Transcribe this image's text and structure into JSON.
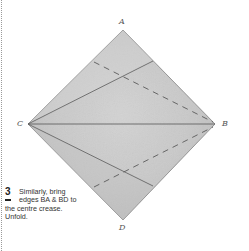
{
  "diagram": {
    "vertices": {
      "A": {
        "label": "A",
        "x": 123,
        "y": 30
      },
      "B": {
        "label": "B",
        "x": 215,
        "y": 124
      },
      "C": {
        "label": "C",
        "x": 28,
        "y": 124
      },
      "D": {
        "label": "D",
        "x": 123,
        "y": 220
      }
    },
    "paper_color": "#cbcbcb",
    "paper_edge_color": "#8a8a8a",
    "crease_color": "#555555",
    "creases": [
      {
        "type": "solid",
        "from": "C",
        "to": "B",
        "description": "centre crease"
      },
      {
        "type": "solid",
        "from": "C",
        "to": "point on AB",
        "x1": 28,
        "y1": 124,
        "x2": 153,
        "y2": 61
      },
      {
        "type": "solid",
        "from": "C",
        "to": "point on BD",
        "x1": 28,
        "y1": 124,
        "x2": 153,
        "y2": 186
      },
      {
        "type": "dashed",
        "from": "point on CA",
        "to": "B",
        "x1": 94,
        "y1": 62,
        "x2": 213,
        "y2": 122
      },
      {
        "type": "dashed",
        "from": "point on CD",
        "to": "B",
        "x1": 94,
        "y1": 187,
        "x2": 213,
        "y2": 127
      }
    ]
  },
  "caption": {
    "step_number": "3",
    "lines": [
      "Similarly, bring",
      "edges BA & BD to",
      "the centre crease.",
      "Unfold."
    ]
  }
}
